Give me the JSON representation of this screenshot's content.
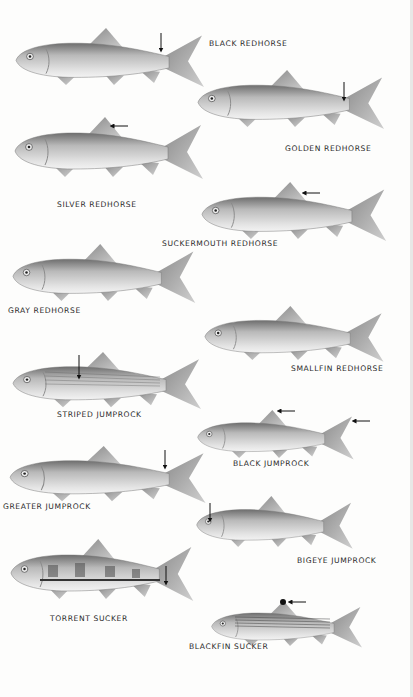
{
  "plate": {
    "background": "#fdfdfc",
    "fish": [
      {
        "id": "black-redhorse",
        "label": "BLACK REDHORSE",
        "arrow": "caudal-peduncle-down"
      },
      {
        "id": "golden-redhorse",
        "label": "GOLDEN REDHORSE",
        "arrow": "caudal-peduncle-down"
      },
      {
        "id": "silver-redhorse",
        "label": "SILVER REDHORSE",
        "arrow": "dorsal-fin-left"
      },
      {
        "id": "suckermouth-redhorse",
        "label": "SUCKERMOUTH REDHORSE",
        "arrow": "dorsal-fin-left"
      },
      {
        "id": "gray-redhorse",
        "label": "GRAY REDHORSE",
        "arrow": "none"
      },
      {
        "id": "smallfin-redhorse",
        "label": "SMALLFIN REDHORSE",
        "arrow": "none"
      },
      {
        "id": "striped-jumprock",
        "label": "STRIPED JUMPROCK",
        "arrow": "body-stripes-down"
      },
      {
        "id": "black-jumprock",
        "label": "BLACK JUMPROCK",
        "arrow": "dorsal-and-caudal-tips-left"
      },
      {
        "id": "greater-jumprock",
        "label": "GREATER JUMPROCK",
        "arrow": "caudal-peduncle-down"
      },
      {
        "id": "bigeye-jumprock",
        "label": "BIGEYE JUMPROCK",
        "arrow": "eye-down"
      },
      {
        "id": "torrent-sucker",
        "label": "TORRENT SUCKER",
        "arrow": "caudal-base-down"
      },
      {
        "id": "blackfin-sucker",
        "label": "BLACKFIN SUCKER",
        "arrow": "dorsal-tip-left"
      }
    ]
  }
}
